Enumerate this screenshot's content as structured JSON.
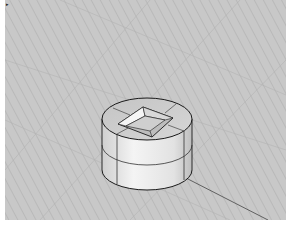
{
  "viewport": {
    "name": "Perspective",
    "label_icon": "viewport-menu-arrow-icon",
    "label_marker": "▸",
    "background": "#c9c9c9",
    "grid_color": "#b4b4b4",
    "axis_color": "#555555",
    "object": {
      "type": "cylinder-with-square-hole",
      "edge_color": "#1a1a1a",
      "surface_color": "#e6e6e6"
    }
  }
}
